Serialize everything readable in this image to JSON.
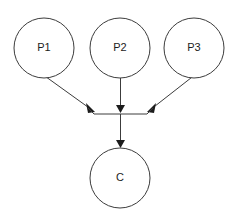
{
  "diagram": {
    "background_color": "#ffffff",
    "stroke_color": "#3c3c3c",
    "label_color": "#1c1c1c",
    "arrow_color": "#1c1c1c",
    "nodes": [
      {
        "id": "p1",
        "label": "P1",
        "role": "parent",
        "cx": 44,
        "cy": 48,
        "r": 30
      },
      {
        "id": "p2",
        "label": "P2",
        "role": "parent",
        "cx": 120,
        "cy": 48,
        "r": 30
      },
      {
        "id": "p3",
        "label": "P3",
        "role": "parent",
        "cx": 194,
        "cy": 48,
        "r": 30
      },
      {
        "id": "c",
        "label": "C",
        "role": "child",
        "cx": 120,
        "cy": 178,
        "r": 30
      }
    ],
    "junction": {
      "label": "merge-bar",
      "y": 114,
      "x_left": 93,
      "x_right": 148
    },
    "edges": [
      {
        "id": "p1-to-junction",
        "from": "P1",
        "to": "junction",
        "style": "diagonal-arrow"
      },
      {
        "id": "p2-to-junction",
        "from": "P2",
        "to": "junction",
        "style": "vertical-arrow"
      },
      {
        "id": "p3-to-junction",
        "from": "P3",
        "to": "junction",
        "style": "diagonal-arrow"
      },
      {
        "id": "junction-to-c",
        "from": "junction",
        "to": "C",
        "style": "vertical-arrow"
      }
    ]
  }
}
